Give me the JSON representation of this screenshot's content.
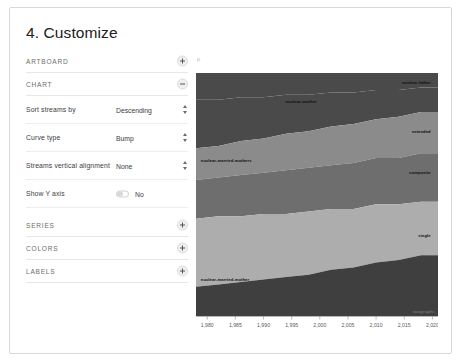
{
  "card": {
    "title": "4. Customize"
  },
  "panel": {
    "sections": [
      {
        "label": "ARTBOARD",
        "state": "collapsed",
        "toggle_icon": "plus-icon"
      },
      {
        "label": "CHART",
        "state": "expanded",
        "toggle_icon": "minus-icon"
      },
      {
        "label": "SERIES",
        "state": "collapsed",
        "toggle_icon": "plus-icon"
      },
      {
        "label": "COLORS",
        "state": "collapsed",
        "toggle_icon": "plus-icon"
      },
      {
        "label": "LABELS",
        "state": "collapsed",
        "toggle_icon": "plus-icon"
      }
    ],
    "chart_fields": [
      {
        "label": "Sort streams by",
        "value": "Descending",
        "control": "select",
        "icon": "stepper-arrows-icon"
      },
      {
        "label": "Curve type",
        "value": "Bump",
        "control": "select",
        "icon": "stepper-arrows-icon"
      },
      {
        "label": "Streams vertical alignment",
        "value": "None",
        "control": "select",
        "icon": "stepper-arrows-icon"
      },
      {
        "label": "Show Y axis",
        "value": "No",
        "control": "switch",
        "switch_state": "off"
      }
    ]
  },
  "chart_area": {
    "stray_mark": "p",
    "watermark": "rawgraphs"
  },
  "chart_data": {
    "type": "area",
    "subtype": "streamgraph",
    "title": "",
    "xlabel": "",
    "ylabel": "",
    "grid": false,
    "legend_position": "inline-labels",
    "xlim": [
      1978,
      2021
    ],
    "x_ticks": [
      "1,980",
      "1,985",
      "1,990",
      "1,995",
      "2,000",
      "2,005",
      "2,010",
      "2,015",
      "2,020"
    ],
    "x_tick_values": [
      1980,
      1985,
      1990,
      1995,
      2000,
      2005,
      2010,
      2015,
      2020
    ],
    "x": [
      1978,
      1982,
      1986,
      1990,
      1994,
      1998,
      2002,
      2006,
      2010,
      2014,
      2018,
      2021
    ],
    "colors": [
      "#4a4a4a",
      "#8b8b8b",
      "#b4b4b4",
      "#6e6e6e",
      "#adadad",
      "#3f3f3f"
    ],
    "series": [
      {
        "name": "nuclear-father",
        "color": "#4a4a4a",
        "label_anchor": "end",
        "values": [
          11,
          11,
          10,
          10,
          9,
          9,
          8,
          8,
          7,
          7,
          6,
          6
        ]
      },
      {
        "name": "nuclear-mother",
        "color": "#4a4a4a",
        "label_anchor": "middle",
        "values": [
          20,
          19,
          18,
          17,
          16,
          15,
          14,
          13,
          12,
          11,
          10,
          10
        ]
      },
      {
        "name": "extended",
        "color": "#8b8b8b",
        "label_anchor": "end",
        "values": [
          13,
          13,
          14,
          14,
          15,
          15,
          16,
          16,
          16,
          17,
          17,
          17
        ]
      },
      {
        "name": "composite",
        "color": "#6e6e6e",
        "label_anchor": "end",
        "values": [
          16,
          16,
          17,
          17,
          18,
          18,
          18,
          19,
          19,
          19,
          20,
          20
        ]
      },
      {
        "name": "nuclear-married-mothers",
        "color": "#adadad",
        "label_anchor": "start",
        "values": [
          28,
          28,
          27,
          27,
          26,
          26,
          25,
          24,
          24,
          23,
          22,
          22
        ]
      },
      {
        "name": "single",
        "color": "#3f3f3f",
        "label_anchor": "end",
        "values": [
          12,
          13,
          14,
          15,
          16,
          17,
          19,
          20,
          22,
          23,
          25,
          25
        ]
      },
      {
        "name": "nuclear-married-mother",
        "color": "#3f3f3f",
        "label_anchor": "start",
        "values": [
          12,
          13,
          14,
          15,
          16,
          17,
          19,
          20,
          22,
          23,
          25,
          25
        ]
      }
    ],
    "inline_labels": [
      {
        "text": "nuclear-father",
        "x_pct": 97,
        "y_pct": 2,
        "anchor": "end",
        "fill": "#111111"
      },
      {
        "text": "nuclear-mother",
        "x_pct": 37,
        "y_pct": 10,
        "anchor": "start",
        "fill": "#111111"
      },
      {
        "text": "extended",
        "x_pct": 97,
        "y_pct": 22,
        "anchor": "end",
        "fill": "#111111"
      },
      {
        "text": "composite",
        "x_pct": 97,
        "y_pct": 39,
        "anchor": "end",
        "fill": "#111111"
      },
      {
        "text": "nuclear-married-mothers",
        "x_pct": 2,
        "y_pct": 34,
        "anchor": "start",
        "fill": "#111111"
      },
      {
        "text": "single",
        "x_pct": 97,
        "y_pct": 65,
        "anchor": "end",
        "fill": "#111111"
      },
      {
        "text": "nuclear-married-mother",
        "x_pct": 2,
        "y_pct": 83,
        "anchor": "start",
        "fill": "#111111"
      }
    ]
  }
}
